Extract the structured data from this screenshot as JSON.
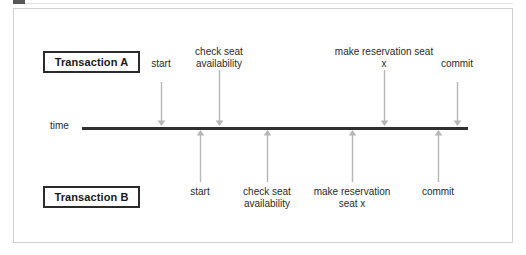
{
  "diagram": {
    "title_fragment": "",
    "time_axis_label": "time",
    "axis": {
      "x_start": 82,
      "x_end": 468,
      "y": 128
    },
    "lanes": [
      {
        "id": "transaction-a",
        "box_label": "Transaction A",
        "position": "above-axis",
        "arrow_direction": "down",
        "events": [
          {
            "label": "start",
            "x": 161,
            "label_lines": [
              "start"
            ],
            "label_y": 58
          },
          {
            "label": "check seat availability",
            "x": 219,
            "label_lines": [
              "check seat",
              "availability"
            ],
            "label_y": 46
          },
          {
            "label": "make reservation seat x",
            "x": 384,
            "label_lines": [
              "make reservation seat",
              "x"
            ],
            "label_y": 46
          },
          {
            "label": "commit",
            "x": 457,
            "label_lines": [
              "commit"
            ],
            "label_y": 58
          }
        ]
      },
      {
        "id": "transaction-b",
        "box_label": "Transaction B",
        "position": "below-axis",
        "arrow_direction": "up",
        "events": [
          {
            "label": "start",
            "x": 200,
            "label_lines": [
              "start"
            ],
            "label_y": 186
          },
          {
            "label": "check seat availability",
            "x": 267,
            "label_lines": [
              "check seat",
              "availability"
            ],
            "label_y": 186
          },
          {
            "label": "make reservation seat x",
            "x": 352,
            "label_lines": [
              "make reservation",
              "seat x"
            ],
            "label_y": 186
          },
          {
            "label": "commit",
            "x": 438,
            "label_lines": [
              "commit"
            ],
            "label_y": 186
          }
        ]
      }
    ],
    "colors": {
      "axis": "#2f2f2f",
      "arrow": "#b6b6b6",
      "box_border": "#2b2b2b",
      "frame_border": "#d2d2d2",
      "text": "#2b2b2b",
      "background": "#ffffff"
    }
  }
}
